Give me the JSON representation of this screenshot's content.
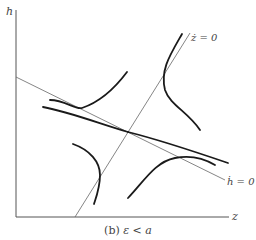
{
  "figure": {
    "caption_prefix": "(b)",
    "caption_math": "ε < a",
    "axes": {
      "x_label": "z",
      "y_label": "h"
    },
    "nullclines": [
      {
        "id": "z_dot_zero",
        "label": "ż = 0"
      },
      {
        "id": "h_dot_zero",
        "label": "ḣ = 0"
      }
    ],
    "colors": {
      "axis": "#555555",
      "nullcline": "#666666",
      "trajectory": "#1a1a1a",
      "text": "#444444"
    },
    "equilibrium": {
      "type": "saddle"
    }
  }
}
